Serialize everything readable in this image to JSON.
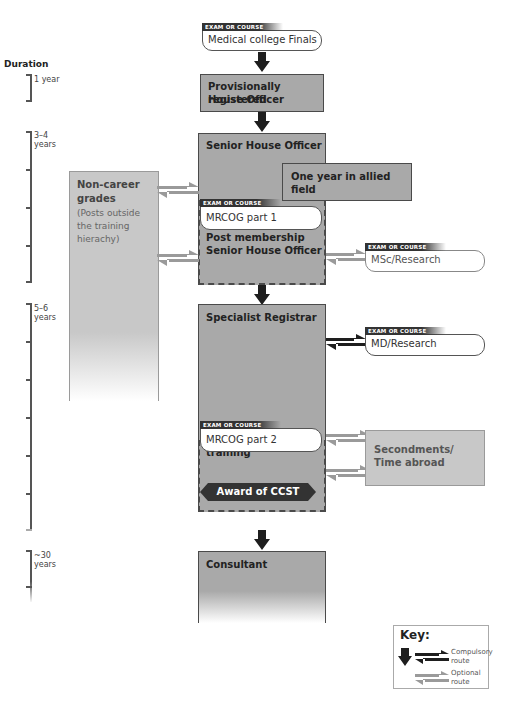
{
  "duration": {
    "title": "Duration",
    "segments": [
      {
        "label": "1 year"
      },
      {
        "label": "3–4\nyears"
      },
      {
        "label": "5–6\nyears"
      },
      {
        "label": "~30\nyears"
      }
    ]
  },
  "exam_tag": "EXAM OR COURSE",
  "stages": {
    "finals": {
      "exam": "Medical college Finals"
    },
    "prho": {
      "title": "Provisionally registered House Officer",
      "line1": "Provisionally registered",
      "line2": "House Officer"
    },
    "sho": {
      "title": "Senior House Officer"
    },
    "allied": {
      "title": "One year in allied field"
    },
    "mrcog1": {
      "exam": "MRCOG part 1"
    },
    "post_membership": {
      "line1": "Post membership",
      "line2": "Senior House Officer"
    },
    "msc": {
      "exam": "MSc/Research"
    },
    "spr": {
      "title": "Specialist Registrar"
    },
    "md": {
      "exam": "MD/Research"
    },
    "mrcog2": {
      "exam": "MRCOG part 2"
    },
    "subspecialty": {
      "title": "Subspecialty training"
    },
    "ccst": {
      "title": "Award of CCST"
    },
    "consultant": {
      "title": "Consultant"
    }
  },
  "side_boxes": {
    "non_career": {
      "title_line1": "Non-career",
      "title_line2": "grades",
      "sub1": "(Posts outside",
      "sub2": "the training",
      "sub3": "hierachy)"
    },
    "secondments": {
      "line1": "Secondments/",
      "line2": "Time abroad"
    }
  },
  "key": {
    "title": "Key:",
    "compulsory_line1": "Compulsory",
    "compulsory_line2": "route",
    "optional_line1": "Optional",
    "optional_line2": "route"
  },
  "colors": {
    "main_box": "#a9a9a9",
    "side_box": "#c8c8c8",
    "compulsory_arrow": "#1e1e1e",
    "optional_arrow": "#9a9a9a"
  }
}
